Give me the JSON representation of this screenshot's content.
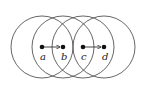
{
  "diagram": {
    "radius": 31,
    "nodes": [
      {
        "id": "a",
        "label": "a",
        "x": 42,
        "y": 47
      },
      {
        "id": "b",
        "label": "b",
        "x": 63,
        "y": 47
      },
      {
        "id": "c",
        "label": "c",
        "x": 83,
        "y": 47
      },
      {
        "id": "d",
        "label": "d",
        "x": 104,
        "y": 47
      }
    ],
    "edges": [
      {
        "from": "a",
        "to": "b",
        "type": "arrow"
      },
      {
        "from": "c",
        "to": "d",
        "type": "arrow"
      }
    ],
    "colors": {
      "stroke": "#555555",
      "dot": "#111111"
    }
  }
}
